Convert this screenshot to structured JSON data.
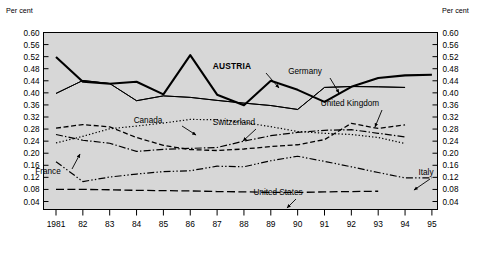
{
  "chart_data": {
    "type": "line",
    "title": "",
    "xlabel": "",
    "ylabel": "Per cent",
    "ylabel_right": "Per cent",
    "ylim": [
      0.02,
      0.6
    ],
    "yticks": [
      "0.60",
      "0.56",
      "0.52",
      "0.48",
      "0.44",
      "0.40",
      "0.36",
      "0.32",
      "0.28",
      "0.24",
      "0.20",
      "0.16",
      "0.12",
      "0.08",
      "0.04"
    ],
    "ytick_values": [
      0.6,
      0.56,
      0.52,
      0.48,
      0.44,
      0.4,
      0.36,
      0.32,
      0.28,
      0.24,
      0.2,
      0.16,
      0.12,
      0.08,
      0.04
    ],
    "xlim": [
      1981,
      1995
    ],
    "categories": [
      "1981",
      "82",
      "83",
      "84",
      "85",
      "86",
      "87",
      "88",
      "89",
      "90",
      "91",
      "92",
      "93",
      "94",
      "95"
    ],
    "x": [
      1981,
      1982,
      1983,
      1984,
      1985,
      1986,
      1987,
      1988,
      1989,
      1990,
      1991,
      1992,
      1993,
      1994,
      1995
    ],
    "grid": false,
    "legend": "inline-annotations",
    "plot_background": "#d7d7d7",
    "series": [
      {
        "name": "AUSTRIA",
        "style": "solid-thick",
        "width": 2.1,
        "color": "#000000",
        "values": [
          0.519,
          0.437,
          0.43,
          0.437,
          0.395,
          0.525,
          0.394,
          0.359,
          0.44,
          0.41,
          0.37,
          0.42,
          0.449,
          0.458,
          0.46
        ]
      },
      {
        "name": "Germany",
        "style": "solid-thin",
        "width": 1.0,
        "color": "#000000",
        "values": [
          0.398,
          0.441,
          0.431,
          0.374,
          0.39,
          0.385,
          0.375,
          0.366,
          0.358,
          0.345,
          0.418,
          0.421,
          0.42,
          0.418,
          null
        ]
      },
      {
        "name": "Switzerland",
        "style": "solid-thin",
        "width": 1.0,
        "color": "#000000",
        "values": [
          0.398,
          0.441,
          0.431,
          0.374,
          0.39,
          0.385,
          0.375,
          0.366,
          0.358,
          0.345,
          0.418,
          0.421,
          0.42,
          0.418,
          null
        ]
      },
      {
        "name": "Canada",
        "style": "dotted",
        "width": 1.2,
        "color": "#000000",
        "values": [
          0.234,
          0.256,
          0.281,
          0.29,
          0.3,
          0.312,
          0.311,
          0.302,
          0.288,
          0.272,
          0.266,
          0.262,
          0.252,
          0.232,
          null
        ]
      },
      {
        "name": "United Kingdom",
        "style": "dashed",
        "width": 1.3,
        "color": "#000000",
        "values": [
          0.283,
          0.295,
          0.287,
          0.252,
          0.226,
          0.212,
          0.209,
          0.214,
          0.222,
          0.228,
          0.245,
          0.299,
          0.282,
          0.294,
          null
        ]
      },
      {
        "name": "France",
        "style": "dashdot",
        "width": 1.2,
        "color": "#000000",
        "values": [
          0.262,
          0.243,
          0.233,
          0.206,
          0.213,
          0.216,
          0.219,
          0.24,
          0.258,
          0.269,
          0.276,
          0.278,
          0.266,
          0.254,
          null
        ]
      },
      {
        "name": "Italy",
        "style": "dashdotdot",
        "width": 1.2,
        "color": "#000000",
        "values": [
          0.172,
          0.106,
          0.121,
          0.131,
          0.139,
          0.142,
          0.157,
          0.155,
          0.175,
          0.19,
          0.173,
          0.155,
          0.136,
          0.118,
          0.118
        ]
      },
      {
        "name": "United States",
        "style": "longdash",
        "width": 1.3,
        "color": "#000000",
        "values": [
          0.08,
          0.08,
          0.079,
          0.077,
          0.076,
          0.075,
          0.073,
          0.072,
          0.07,
          0.07,
          0.072,
          0.073,
          0.074,
          null,
          null
        ]
      }
    ],
    "annotations": [
      {
        "label": "AUSTRIA",
        "bold": true,
        "text_x": 232,
        "text_y": 69,
        "arrow": [
          266,
          73,
          279,
          88
        ]
      },
      {
        "label": "Germany",
        "bold": false,
        "text_x": 305,
        "text_y": 74,
        "arrow": [
          330,
          78,
          339,
          93
        ]
      },
      {
        "label": "Switzerland",
        "bold": false,
        "text_x": 234,
        "text_y": 125,
        "arrow": [
          256,
          129,
          243,
          141
        ]
      },
      {
        "label": "Canada",
        "bold": false,
        "text_x": 148,
        "text_y": 123,
        "arrow": [
          182,
          126,
          196,
          135
        ]
      },
      {
        "label": "United Kingdom",
        "bold": false,
        "text_x": 350,
        "text_y": 106,
        "arrow": [
          382,
          110,
          375,
          127
        ]
      },
      {
        "label": "France",
        "bold": false,
        "text_x": 48,
        "text_y": 174,
        "arrow": [
          72,
          169,
          80,
          154
        ]
      },
      {
        "label": "United States",
        "bold": false,
        "text_x": 278,
        "text_y": 195,
        "arrow": [
          296,
          199,
          287,
          208
        ]
      },
      {
        "label": "Italy",
        "bold": false,
        "text_x": 426,
        "text_y": 175,
        "arrow": [
          430,
          179,
          414,
          190
        ]
      }
    ]
  }
}
